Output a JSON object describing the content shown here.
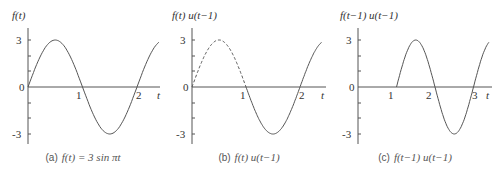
{
  "chart_data": [
    {
      "type": "line",
      "title": "f(t)",
      "caption_label": "(a)",
      "caption_eq": "f(t) = 3 sin πt",
      "xlabel": "t",
      "ylabel": "f(t)",
      "xticks": [
        "1",
        "2"
      ],
      "yticks": [
        "3",
        "0",
        "-3"
      ],
      "xlim": [
        0,
        2.4
      ],
      "ylim": [
        -3,
        3
      ],
      "series": [
        {
          "name": "f(t)",
          "style": "solid",
          "x_range": [
            0,
            2.4
          ],
          "expr": "3*sin(pi*t)"
        }
      ]
    },
    {
      "type": "line",
      "title": "f(t) u(t−1)",
      "caption_label": "(b)",
      "caption_eq": "f(t) u(t−1)",
      "xlabel": "t",
      "ylabel": "f(t) u(t−1)",
      "xticks": [
        "1",
        "2"
      ],
      "yticks": [
        "3",
        "0",
        "-3"
      ],
      "xlim": [
        0,
        2.4
      ],
      "ylim": [
        -3,
        3
      ],
      "series": [
        {
          "name": "f(t) for t<1",
          "style": "dashed",
          "x_range": [
            0,
            1
          ],
          "expr": "3*sin(pi*t)"
        },
        {
          "name": "f(t)u(t-1)",
          "style": "solid",
          "x_range": [
            1,
            2.4
          ],
          "expr": "3*sin(pi*t)"
        }
      ]
    },
    {
      "type": "line",
      "title": "f(t−1) u(t−1)",
      "caption_label": "(c)",
      "caption_eq": "f(t−1) u(t−1)",
      "xlabel": "t",
      "ylabel": "f(t−1) u(t−1)",
      "xticks": [
        "1",
        "2",
        "3"
      ],
      "yticks": [
        "3",
        "0",
        "-3"
      ],
      "xlim": [
        0,
        3.4
      ],
      "ylim": [
        -3,
        3
      ],
      "series": [
        {
          "name": "f(t-1)u(t-1)",
          "style": "solid",
          "x_range": [
            1,
            3.4
          ],
          "expr": "3*sin(pi*(t-1))"
        }
      ]
    }
  ]
}
